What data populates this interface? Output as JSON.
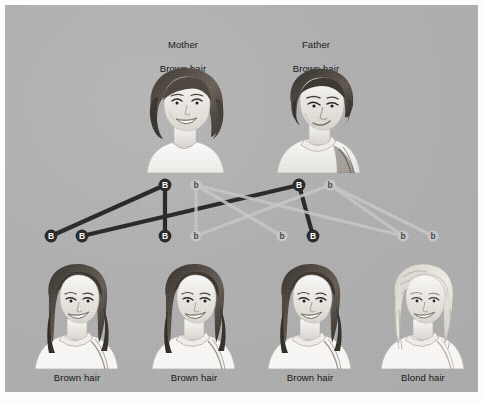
{
  "figure": {
    "background_color": "#b0b0b0",
    "frame_color": "#fdfdfd"
  },
  "parents": [
    {
      "id": "mother",
      "role_label": "Mother",
      "trait_label": "Brown hair",
      "portrait": "woman-portrait"
    },
    {
      "id": "father",
      "role_label": "Father",
      "trait_label": "Brown hair",
      "portrait": "man-portrait"
    }
  ],
  "children": [
    {
      "id": "child-1",
      "trait_label": "Brown hair",
      "portrait": "child-dark-hair-portrait"
    },
    {
      "id": "child-2",
      "trait_label": "Brown hair",
      "portrait": "child-dark-hair-portrait"
    },
    {
      "id": "child-3",
      "trait_label": "Brown hair",
      "portrait": "child-dark-hair-portrait"
    },
    {
      "id": "child-4",
      "trait_label": "Blond hair",
      "portrait": "child-blond-hair-portrait"
    }
  ],
  "alleles": {
    "dominant_symbol": "B",
    "recessive_symbol": "b",
    "dominant_color": "#262626",
    "recessive_color": "#c9c9c9",
    "dominant_text_color": "#ffffff",
    "recessive_text_color": "#4a4a4a",
    "nodes": [
      {
        "id": "n-mB-top",
        "symbol": "B",
        "type": "dominant",
        "x": 160,
        "y": 180
      },
      {
        "id": "n-mb-top",
        "symbol": "b",
        "type": "recessive",
        "x": 191,
        "y": 180
      },
      {
        "id": "n-fB-top",
        "symbol": "B",
        "type": "dominant",
        "x": 294,
        "y": 180
      },
      {
        "id": "n-fb-top",
        "symbol": "b",
        "type": "recessive",
        "x": 325,
        "y": 180
      },
      {
        "id": "n-c1-B",
        "symbol": "B",
        "type": "dominant",
        "x": 46,
        "y": 231
      },
      {
        "id": "n-c1-B2",
        "symbol": "B",
        "type": "dominant",
        "x": 77,
        "y": 231
      },
      {
        "id": "n-c2-B",
        "symbol": "B",
        "type": "dominant",
        "x": 160,
        "y": 231
      },
      {
        "id": "n-c2-b",
        "symbol": "b",
        "type": "recessive",
        "x": 191,
        "y": 231
      },
      {
        "id": "n-c3-b",
        "symbol": "b",
        "type": "recessive",
        "x": 277,
        "y": 231
      },
      {
        "id": "n-c3-B",
        "symbol": "B",
        "type": "dominant",
        "x": 308,
        "y": 231
      },
      {
        "id": "n-c4-b",
        "symbol": "b",
        "type": "recessive",
        "x": 398,
        "y": 231
      },
      {
        "id": "n-c4-b2",
        "symbol": "b",
        "type": "recessive",
        "x": 428,
        "y": 231
      }
    ],
    "links": [
      {
        "id": "link-mB-c1",
        "from": "n-mB-top",
        "to": "n-c1-B",
        "type": "dominant"
      },
      {
        "id": "link-mB-c2",
        "from": "n-mB-top",
        "to": "n-c2-B",
        "type": "dominant"
      },
      {
        "id": "link-fB-c1b",
        "from": "n-fB-top",
        "to": "n-c1-B2",
        "type": "dominant"
      },
      {
        "id": "link-fB-c3",
        "from": "n-fB-top",
        "to": "n-c3-B",
        "type": "dominant"
      },
      {
        "id": "link-mb-c3",
        "from": "n-mb-top",
        "to": "n-c3-b",
        "type": "recessive"
      },
      {
        "id": "link-mb-c2b",
        "from": "n-mb-top",
        "to": "n-c2-b",
        "type": "recessive"
      },
      {
        "id": "link-fb-c2b",
        "from": "n-fb-top",
        "to": "n-c4-b",
        "type": "recessive"
      },
      {
        "id": "link-fb-c4",
        "from": "n-fb-top",
        "to": "n-c4-b2",
        "type": "recessive"
      },
      {
        "id": "link-mb-x",
        "from": "n-mb-top",
        "to": "n-c4-b",
        "type": "recessive"
      },
      {
        "id": "link-fb-x",
        "from": "n-fb-top",
        "to": "n-c2-b",
        "type": "recessive"
      }
    ]
  }
}
